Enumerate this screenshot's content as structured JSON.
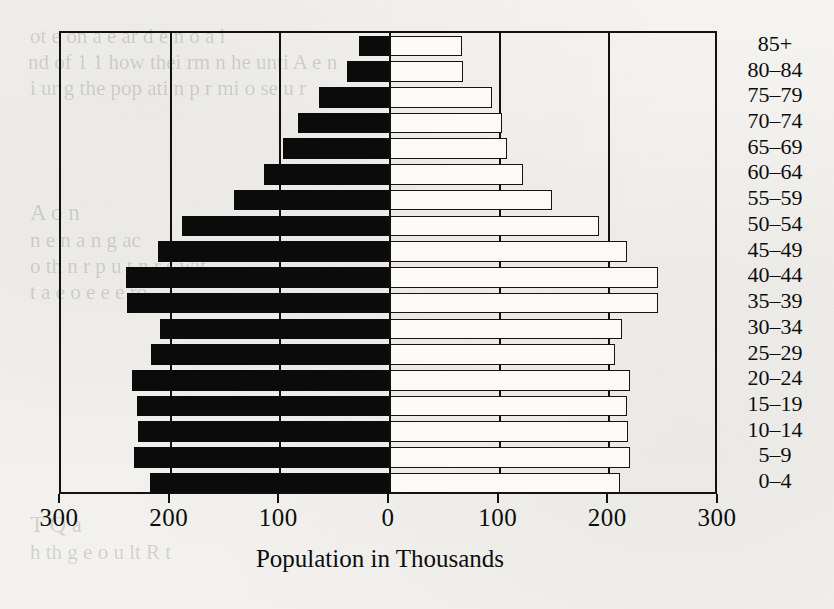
{
  "chart_data": {
    "type": "bar",
    "subtype": "population-pyramid",
    "title": "",
    "xlabel": "Population in Thousands",
    "ylabel": "",
    "xlim": [
      -300,
      300
    ],
    "xticks": [
      -300,
      -200,
      -100,
      0,
      100,
      200,
      300
    ],
    "xticklabels": [
      "300",
      "200",
      "100",
      "0",
      "100",
      "200",
      "300"
    ],
    "grid": true,
    "grid_axis": "x",
    "legend": null,
    "orientation": "horizontal",
    "categories": [
      "0–4",
      "5–9",
      "10–14",
      "15–19",
      "20–24",
      "25–29",
      "30–34",
      "35–39",
      "40–44",
      "45–49",
      "50–54",
      "55–59",
      "60–64",
      "65–69",
      "70–74",
      "75–79",
      "80–84",
      "85+"
    ],
    "series": [
      {
        "name": "Male",
        "side": "left",
        "color": "#0b0b0b",
        "values": [
          219,
          233,
          230,
          231,
          235,
          218,
          210,
          240,
          241,
          212,
          190,
          142,
          115,
          98,
          84,
          65,
          39,
          28
        ]
      },
      {
        "name": "Female",
        "side": "right",
        "color": "#fbfaf7",
        "values": [
          210,
          219,
          217,
          216,
          219,
          205,
          212,
          244,
          244,
          216,
          191,
          148,
          121,
          107,
          102,
          93,
          67,
          66
        ]
      }
    ]
  },
  "axis": {
    "tick_labels": [
      "300",
      "200",
      "100",
      "0",
      "100",
      "200",
      "300"
    ],
    "x_title": "Population in Thousands"
  },
  "page_background_text": [
    {
      "text": "ot  e  on  a e  ar   d  e n    o a   i",
      "x": 30,
      "y": 24,
      "size": 21
    },
    {
      "text": "nd   of   1 1  how  thei    rm     n  he  unti  A  e   n  ",
      "x": 28,
      "y": 50,
      "size": 21
    },
    {
      "text": "i   ur   g  the  pop  ati n p  r  mi  o    se    u   r  ",
      "x": 30,
      "y": 76,
      "size": 21
    },
    {
      "text": "A  o n",
      "x": 30,
      "y": 200,
      "size": 23
    },
    {
      "text": "n   e     n   a         n       g   ac",
      "x": 30,
      "y": 228,
      "size": 21
    },
    {
      "text": "o  th   n   r    p   u  t  n   r   s   wit",
      "x": 30,
      "y": 254,
      "size": 21
    },
    {
      "text": "t  a    e       o     e        e    e  ro",
      "x": 30,
      "y": 280,
      "size": 21
    },
    {
      "text": "T    Q  a",
      "x": 30,
      "y": 512,
      "size": 23
    },
    {
      "text": "h   th     g    e   o     u   lt   R    t",
      "x": 30,
      "y": 540,
      "size": 21
    }
  ]
}
